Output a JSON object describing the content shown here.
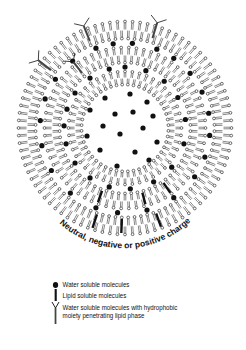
{
  "diagram": {
    "center": [
      125,
      128
    ],
    "bilayers": [
      {
        "name": "outer",
        "r_out": 108,
        "r_in": 88,
        "count": 88
      },
      {
        "name": "middle",
        "r_out": 82,
        "r_in": 64,
        "count": 66
      },
      {
        "name": "inner",
        "r_out": 58,
        "r_in": 42,
        "count": 48
      }
    ],
    "core_dots": [
      [
        -20,
        -30
      ],
      [
        5,
        -34
      ],
      [
        22,
        -26
      ],
      [
        -35,
        -18
      ],
      [
        -10,
        -14
      ],
      [
        8,
        -16
      ],
      [
        28,
        -12
      ],
      [
        -22,
        -2
      ],
      [
        18,
        0
      ],
      [
        -38,
        8
      ],
      [
        -5,
        6
      ],
      [
        32,
        14
      ],
      [
        -25,
        22
      ],
      [
        10,
        24
      ],
      [
        -8,
        38
      ],
      [
        24,
        32
      ]
    ],
    "gap1_dots_angles": [
      200,
      215,
      232,
      250,
      262,
      275,
      292,
      305,
      320,
      335,
      350,
      5,
      20,
      35,
      55,
      75,
      95,
      110,
      130,
      150,
      168,
      185
    ],
    "gap2_dots_angles": [
      198,
      215,
      235,
      255,
      270,
      290,
      310,
      330,
      352,
      15,
      40,
      62,
      85,
      105,
      125,
      145,
      165,
      182
    ],
    "lipid_bars": [
      {
        "angle": 108,
        "layer": "outer"
      },
      {
        "angle": 92,
        "layer": "outer"
      },
      {
        "angle": 70,
        "layer": "outer"
      },
      {
        "angle": 75,
        "layer": "middle"
      },
      {
        "angle": 110,
        "layer": "middle"
      },
      {
        "angle": 55,
        "layer": "middle"
      }
    ],
    "y_molecules": [
      {
        "angle": 248,
        "layer": "outer"
      },
      {
        "angle": 287,
        "layer": "outer"
      },
      {
        "angle": 218,
        "layer": "outer"
      },
      {
        "angle": 232,
        "layer": "middle"
      }
    ],
    "label": "Neutral, negative or positive charge"
  },
  "legend": {
    "items": [
      {
        "icon": "dot-icon",
        "label": "Water soluble molecules"
      },
      {
        "icon": "bar-icon",
        "label": "Lipid soluble molecules"
      },
      {
        "icon": "y-molecule-icon",
        "label_line1": "Water soluble molecules with hydrophobic",
        "label_line2": "moiety penetrating lipid phase"
      }
    ]
  },
  "colors": {
    "ink": "#111111",
    "background": "#ffffff"
  }
}
